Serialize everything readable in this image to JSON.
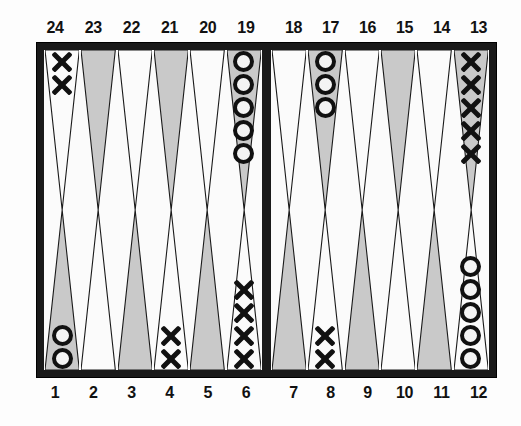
{
  "figure": {
    "kind": "backgammon-board",
    "colors": {
      "frame": "#1a1a1a",
      "surface": "#fbfbfb",
      "shaded_point": "#c9c9c9",
      "white_point": "#fbfbfb",
      "point_outline": "#1a1a1a",
      "checker_dark": "#111111"
    }
  },
  "labels": {
    "top_left": [
      "24",
      "23",
      "22",
      "21",
      "20",
      "19"
    ],
    "top_right": [
      "18",
      "17",
      "16",
      "15",
      "14",
      "13"
    ],
    "bottom_left": [
      "1",
      "2",
      "3",
      "4",
      "5",
      "6"
    ],
    "bottom_right": [
      "7",
      "8",
      "9",
      "10",
      "11",
      "12"
    ]
  },
  "board": {
    "top_left_quadrant": [
      {
        "point": "24",
        "shade": "white",
        "checker": "x",
        "count": 2
      },
      {
        "point": "23",
        "shade": "shaded",
        "checker": "",
        "count": 0
      },
      {
        "point": "22",
        "shade": "white",
        "checker": "",
        "count": 0
      },
      {
        "point": "21",
        "shade": "shaded",
        "checker": "",
        "count": 0
      },
      {
        "point": "20",
        "shade": "white",
        "checker": "",
        "count": 0
      },
      {
        "point": "19",
        "shade": "shaded",
        "checker": "o",
        "count": 5
      }
    ],
    "top_right_quadrant": [
      {
        "point": "18",
        "shade": "white",
        "checker": "",
        "count": 0
      },
      {
        "point": "17",
        "shade": "shaded",
        "checker": "o",
        "count": 3
      },
      {
        "point": "16",
        "shade": "white",
        "checker": "",
        "count": 0
      },
      {
        "point": "15",
        "shade": "shaded",
        "checker": "",
        "count": 0
      },
      {
        "point": "14",
        "shade": "white",
        "checker": "",
        "count": 0
      },
      {
        "point": "13",
        "shade": "shaded",
        "checker": "x",
        "count": 5
      }
    ],
    "bottom_left_quadrant": [
      {
        "point": "1",
        "shade": "shaded",
        "checker": "o",
        "count": 2
      },
      {
        "point": "2",
        "shade": "white",
        "checker": "",
        "count": 0
      },
      {
        "point": "3",
        "shade": "shaded",
        "checker": "",
        "count": 0
      },
      {
        "point": "4",
        "shade": "white",
        "checker": "x",
        "count": 2
      },
      {
        "point": "5",
        "shade": "shaded",
        "checker": "",
        "count": 0
      },
      {
        "point": "6",
        "shade": "white",
        "checker": "x",
        "count": 4
      }
    ],
    "bottom_right_quadrant": [
      {
        "point": "7",
        "shade": "shaded",
        "checker": "",
        "count": 0
      },
      {
        "point": "8",
        "shade": "white",
        "checker": "x",
        "count": 2
      },
      {
        "point": "9",
        "shade": "shaded",
        "checker": "",
        "count": 0
      },
      {
        "point": "10",
        "shade": "white",
        "checker": "",
        "count": 0
      },
      {
        "point": "11",
        "shade": "shaded",
        "checker": "",
        "count": 0
      },
      {
        "point": "12",
        "shade": "white",
        "checker": "o",
        "count": 5
      }
    ]
  }
}
